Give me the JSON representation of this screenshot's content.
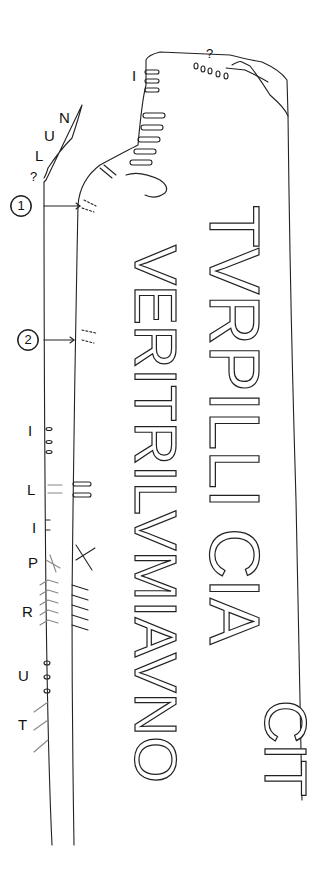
{
  "figure": {
    "type": "epigraphic line drawing of inscribed stone",
    "main_inscription": {
      "line1": "TVRPILLI CIA",
      "line1_right": "CIT",
      "line2": "PVERITRI LVMIAVNOCA",
      "line2_end": "TA"
    },
    "top_marks": {
      "label_I": "I",
      "label_q": "?"
    },
    "left_edge_labels": {
      "n": "N",
      "u": "U",
      "l": "L",
      "q": "?",
      "marker1": "1",
      "marker2": "2",
      "i1": "I",
      "l2": "L",
      "i2": "I",
      "p": "P",
      "r": "R",
      "u2": "U",
      "t": "T"
    },
    "colors": {
      "line": "#222222",
      "background": "#ffffff"
    }
  }
}
